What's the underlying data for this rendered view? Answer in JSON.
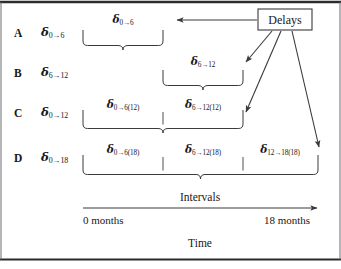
{
  "figure": {
    "rows": [
      {
        "letter": "A",
        "row_label": "δ<sub>0→6</sub>",
        "segments": [
          {
            "label": "δ<sub>0→6</sub>",
            "start_months": 0,
            "end_months": 6
          }
        ],
        "brace_start_months": 0,
        "brace_end_months": 6
      },
      {
        "letter": "B",
        "row_label": "δ<sub>6→12</sub>",
        "segments": [
          {
            "label": "δ<sub>6→12</sub>",
            "start_months": 6,
            "end_months": 12
          }
        ],
        "brace_start_months": 6,
        "brace_end_months": 12
      },
      {
        "letter": "C",
        "row_label": "δ<sub>0→12</sub>",
        "segments": [
          {
            "label": "δ<sub>0→6(12)</sub>",
            "start_months": 0,
            "end_months": 6
          },
          {
            "label": "δ<sub>6→12(12)</sub>",
            "start_months": 6,
            "end_months": 12
          }
        ],
        "brace_start_months": 0,
        "brace_end_months": 12
      },
      {
        "letter": "D",
        "row_label": "δ<sub>0→18</sub>",
        "segments": [
          {
            "label": "δ<sub>0→6(18)</sub>",
            "start_months": 0,
            "end_months": 6
          },
          {
            "label": "δ<sub>6→12(18)</sub>",
            "start_months": 6,
            "end_months": 12
          },
          {
            "label": "δ<sub>12→18(18)</sub>",
            "start_months": 12,
            "end_months": 18
          }
        ],
        "brace_start_months": 0,
        "brace_end_months": 18
      }
    ],
    "delays_box": {
      "label": "Delays",
      "targets": [
        "row-a-endpoint",
        "row-b-endpoint",
        "row-c-endpoint",
        "row-d-endpoint"
      ]
    },
    "axis": {
      "caption": "Intervals",
      "start_label": "0 months",
      "end_label": "18 months",
      "axis_title": "Time",
      "range_months": [
        0,
        18
      ]
    },
    "colors": {
      "ink": "#17171a",
      "line": "#3a3a3c",
      "background": "#ffffff",
      "rule": "#2b2b2e"
    }
  }
}
